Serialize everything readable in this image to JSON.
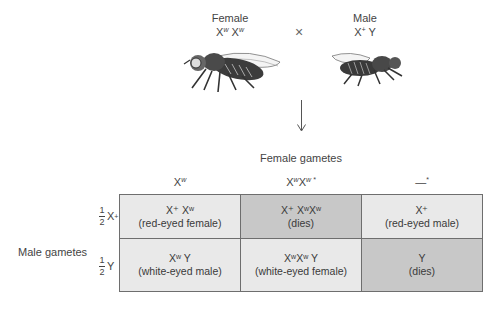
{
  "parents": {
    "female": {
      "label": "Female",
      "genotype_base": "X",
      "genotype_sup1": "w",
      "genotype_sup2": "w",
      "icon": "fruit-fly-female-icon"
    },
    "male": {
      "label": "Male",
      "genotype_x_sup": "+",
      "genotype_y": "Y",
      "icon": "fruit-fly-male-icon"
    },
    "cross_symbol": "×"
  },
  "female_gametes_title": "Female gametes",
  "male_gametes_title": "Male gametes",
  "columns": [
    {
      "base": "X",
      "sup": "w",
      "tail": ""
    },
    {
      "base": "X",
      "sup": "w",
      "base2": "X",
      "sup2": "w *"
    },
    {
      "text": "—",
      "sup": "*"
    }
  ],
  "rows": [
    {
      "fraction_num": "1",
      "fraction_den": "2",
      "label": "X",
      "label_sup": "+"
    },
    {
      "fraction_num": "1",
      "fraction_den": "2",
      "label": "Y",
      "label_sup": ""
    }
  ],
  "cells": [
    [
      {
        "genotype": "X⁺ Xʷ",
        "phenotype": "(red-eyed female)",
        "shade": "light"
      },
      {
        "genotype": "X⁺ XʷXʷ",
        "phenotype": "(dies)",
        "shade": "dark"
      },
      {
        "genotype": "X⁺",
        "phenotype": "(red-eyed male)",
        "shade": "light"
      }
    ],
    [
      {
        "genotype": "Xʷ Y",
        "phenotype": "(white-eyed male)",
        "shade": "light"
      },
      {
        "genotype": "XʷXʷ Y",
        "phenotype": "(white-eyed female)",
        "shade": "light"
      },
      {
        "genotype": "Y",
        "phenotype": "(dies)",
        "shade": "dark"
      }
    ]
  ]
}
